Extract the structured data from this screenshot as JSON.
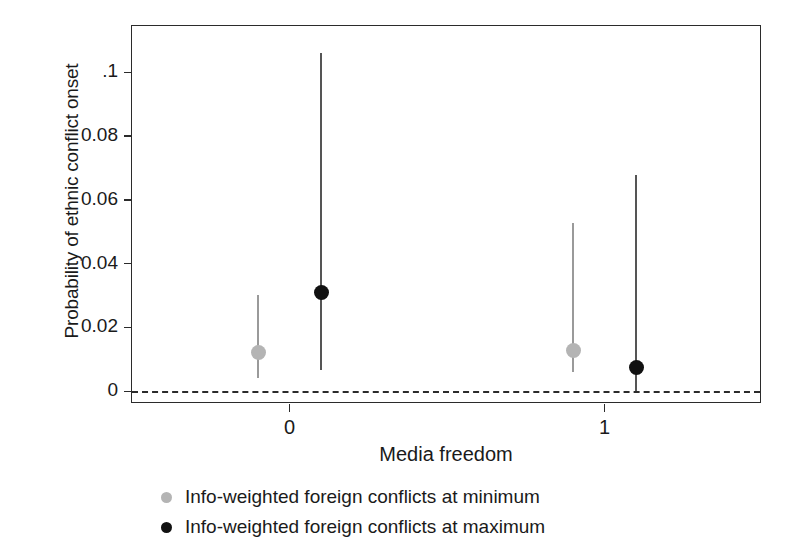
{
  "chart_data": {
    "type": "scatter",
    "title": "",
    "xlabel": "Media freedom",
    "ylabel": "Probability of ethnic conflict onset",
    "xlim": [
      -0.5,
      1.5
    ],
    "ylim": [
      -0.004,
      0.1145
    ],
    "grid": false,
    "legend_position": "bottom",
    "x_ticks": [
      {
        "value": 0,
        "label": "0"
      },
      {
        "value": 1,
        "label": "1"
      }
    ],
    "y_ticks": [
      {
        "value": 0,
        "label": "0"
      },
      {
        "value": 0.02,
        "label": "0.02"
      },
      {
        "value": 0.04,
        "label": "0.04"
      },
      {
        "value": 0.06,
        "label": "0.06"
      },
      {
        "value": 0.08,
        "label": "0.08"
      },
      {
        "value": 0.1,
        "label": ".1"
      }
    ],
    "reference_line": {
      "y": 0,
      "style": "dashed"
    },
    "series": [
      {
        "name": "Info-weighted foreign conflicts at minimum",
        "color": "#b4b4b4",
        "points": [
          {
            "x": -0.1,
            "x_category": "0",
            "y": 0.0121,
            "ci_low": 0.0042,
            "ci_high": 0.0303
          },
          {
            "x": 0.9,
            "x_category": "1",
            "y": 0.0127,
            "ci_low": 0.0061,
            "ci_high": 0.0527
          }
        ]
      },
      {
        "name": "Info-weighted foreign conflicts at maximum",
        "color": "#111111",
        "points": [
          {
            "x": 0.1,
            "x_category": "0",
            "y": 0.0309,
            "ci_low": 0.0067,
            "ci_high": 0.1061
          },
          {
            "x": 1.1,
            "x_category": "1",
            "y": 0.0074,
            "ci_low": 0.0,
            "ci_high": 0.0677
          }
        ]
      }
    ]
  },
  "legend": {
    "items": [
      {
        "label": "Info-weighted foreign conflicts at minimum",
        "color": "#b4b4b4"
      },
      {
        "label": "Info-weighted foreign conflicts at maximum",
        "color": "#111111"
      }
    ]
  },
  "axes": {
    "x_title": "Media freedom",
    "y_title": "Probability of ethnic conflict onset"
  },
  "colors": {
    "axis": "#2b2b2b",
    "text": "#1a1a1a",
    "series_min": "#b4b4b4",
    "series_max": "#111111",
    "background": "#ffffff"
  }
}
